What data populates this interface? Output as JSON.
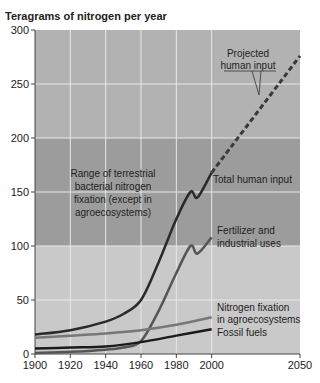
{
  "chart_data": {
    "type": "line",
    "title": "",
    "ylabel": "Teragrams of nitrogen per year",
    "xlabel": "",
    "xlim": [
      1900,
      2050
    ],
    "ylim": [
      0,
      300
    ],
    "x_ticks": [
      1900,
      1920,
      1940,
      1960,
      1980,
      2000,
      2050
    ],
    "y_ticks": [
      0,
      50,
      100,
      150,
      200,
      250,
      300
    ],
    "grid": true,
    "bands": [
      {
        "from": 0,
        "to": 100,
        "color": "#c9c9c9"
      },
      {
        "from": 100,
        "to": 200,
        "color": "#9c9c9c",
        "label": "Range of terrestrial bacterial nitrogen fixation (except in agroecosystems)"
      },
      {
        "from": 200,
        "to": 300,
        "color": "#b2b2b2"
      }
    ],
    "series": [
      {
        "name": "Total human input",
        "color": "#2a2a2a",
        "x": [
          1900,
          1920,
          1940,
          1950,
          1960,
          1970,
          1980,
          1988,
          1992,
          2000
        ],
        "y": [
          18,
          22,
          30,
          37,
          50,
          85,
          125,
          150,
          145,
          168
        ]
      },
      {
        "name": "Projected human input",
        "color": "#3a3a3a",
        "style": "dashed",
        "x": [
          2000,
          2050
        ],
        "y": [
          168,
          276
        ]
      },
      {
        "name": "Fertilizer and industrial uses",
        "color": "#555555",
        "x": [
          1900,
          1920,
          1940,
          1950,
          1960,
          1970,
          1980,
          1988,
          1992,
          2000
        ],
        "y": [
          1,
          2,
          4,
          6,
          12,
          40,
          75,
          100,
          93,
          108
        ]
      },
      {
        "name": "Nitrogen fixation in agroecosystems",
        "color": "#777777",
        "x": [
          1900,
          1920,
          1940,
          1960,
          1980,
          2000
        ],
        "y": [
          15,
          17,
          19,
          22,
          27,
          34
        ]
      },
      {
        "name": "Fossil fuels",
        "color": "#1a1a1a",
        "x": [
          1900,
          1920,
          1940,
          1960,
          1980,
          2000
        ],
        "y": [
          5,
          6,
          7,
          11,
          17,
          23
        ]
      }
    ],
    "annotations": [
      "Range of terrestrial bacterial nitrogen fixation (except in agroecosystems)",
      "Projected human input",
      "Total human input",
      "Fertilizer and industrial uses",
      "Nitrogen fixation in agroecosystems",
      "Fossil fuels"
    ]
  },
  "labels": {
    "y_title": "Teragrams of nitrogen per year",
    "band_label": [
      "Range of terrestrial",
      "bacterial nitrogen",
      "fixation (except in",
      "agroecosystems)"
    ],
    "projected": [
      "Projected",
      "human input"
    ],
    "total": "Total human input",
    "fertilizer": [
      "Fertilizer and",
      "industrial uses"
    ],
    "agro": [
      "Nitrogen fixation",
      "in agroecosystems"
    ],
    "fossil": "Fossil fuels"
  }
}
